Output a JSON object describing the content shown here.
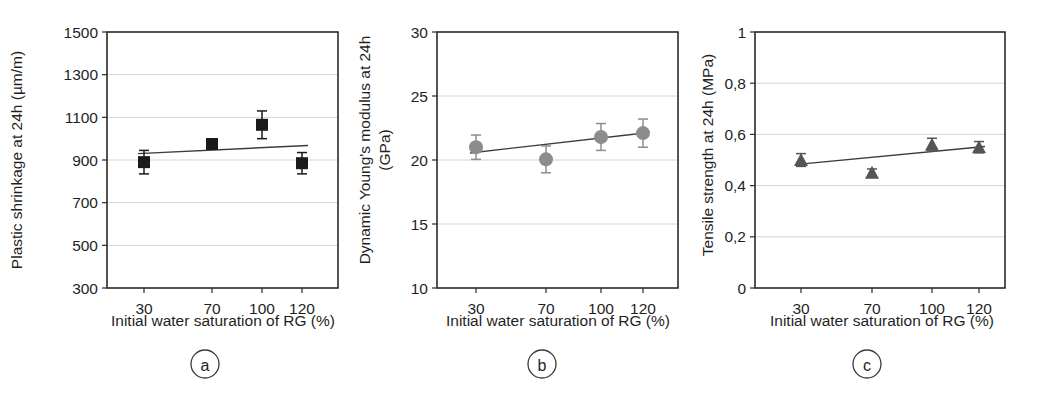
{
  "figure": {
    "title": "",
    "panel_count": 3
  },
  "common": {
    "xlabel": "Initial water saturation of RG (%)",
    "xticks": [
      "30",
      "70",
      "100",
      "120"
    ],
    "x_values": [
      30,
      70,
      100,
      120
    ]
  },
  "chart_data": [
    {
      "type": "scatter",
      "panel_letter": "a",
      "title": "",
      "xlabel": "Initial water saturation of RG (%)",
      "ylabel": "Plastic shrinkage at 24h (µm/m)",
      "ylabel_lines": [
        "Plastic shrinkage at 24h (µm/m)"
      ],
      "categories": [
        "30",
        "70",
        "100",
        "120"
      ],
      "x": [
        30,
        70,
        100,
        120
      ],
      "values": [
        890,
        975,
        1065,
        885
      ],
      "yerr": [
        55,
        18,
        65,
        50
      ],
      "yticks": [
        300,
        500,
        700,
        900,
        1100,
        1300,
        1500
      ],
      "ytick_labels": [
        "300",
        "500",
        "700",
        "900",
        "1100",
        "1300",
        "1500"
      ],
      "ylim": [
        300,
        1500
      ],
      "grid": true,
      "legend": "none",
      "marker": "square",
      "marker_color": "#1a1a1a",
      "trend": {
        "y_start": 930,
        "y_end": 968
      }
    },
    {
      "type": "scatter",
      "panel_letter": "b",
      "title": "",
      "xlabel": "Initial water saturation of RG (%)",
      "ylabel": "Dynamic Young's modulus at 24h (GPa)",
      "ylabel_lines": [
        "Dynamic Young's modulus at 24h",
        "(GPa)"
      ],
      "categories": [
        "30",
        "70",
        "100",
        "120"
      ],
      "x": [
        30,
        70,
        100,
        120
      ],
      "values": [
        21.0,
        20.05,
        21.8,
        22.1
      ],
      "yerr": [
        0.95,
        1.05,
        1.05,
        1.1
      ],
      "yticks": [
        10,
        15,
        20,
        25,
        30
      ],
      "ytick_labels": [
        "10",
        "15",
        "20",
        "25",
        "30"
      ],
      "ylim": [
        10,
        30
      ],
      "grid": true,
      "legend": "none",
      "marker": "circle",
      "marker_color": "#8c8c8c",
      "trend": {
        "y_start": 20.55,
        "y_end": 22.15
      }
    },
    {
      "type": "scatter",
      "panel_letter": "c",
      "title": "",
      "xlabel": "Initial water saturation of RG (%)",
      "ylabel": "Tensile strength at 24h (MPa)",
      "ylabel_lines": [
        "Tensile strength at 24h (MPa)"
      ],
      "categories": [
        "30",
        "70",
        "100",
        "120"
      ],
      "x": [
        30,
        70,
        100,
        120
      ],
      "values": [
        0.5,
        0.45,
        0.56,
        0.55
      ],
      "yerr": [
        0.025,
        0.015,
        0.025,
        0.022
      ],
      "yticks": [
        0,
        0.2,
        0.4,
        0.6,
        0.8,
        1.0
      ],
      "ytick_labels": [
        "0",
        "0,2",
        "0,4",
        "0,6",
        "0,8",
        "1"
      ],
      "ylim": [
        0,
        1
      ],
      "grid": true,
      "legend": "none",
      "marker": "triangle",
      "marker_color": "#555555",
      "trend": {
        "y_start": 0.482,
        "y_end": 0.553
      }
    }
  ],
  "colors": {
    "frame": "#2b2b2b",
    "grid": "#cfcfcf",
    "trend": "#3c3c3c",
    "marker_a": "#1a1a1a",
    "marker_b": "#8c8c8c",
    "marker_c": "#555555",
    "background": "#ffffff"
  }
}
